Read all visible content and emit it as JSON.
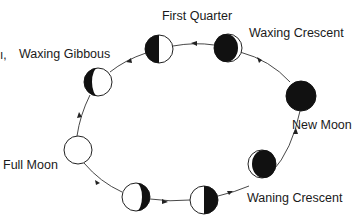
{
  "diagram": {
    "colors": {
      "dark": "#111111",
      "light": "#ffffff",
      "stroke": "#222222",
      "path": "#333333"
    },
    "partial_left_text": "ı,",
    "phases": [
      {
        "id": "new-moon",
        "label": "New Moon"
      },
      {
        "id": "waxing-crescent",
        "label": "Waxing Crescent"
      },
      {
        "id": "first-quarter",
        "label": "First Quarter"
      },
      {
        "id": "waxing-gibbous",
        "label": "Waxing Gibbous"
      },
      {
        "id": "full-moon",
        "label": "Full Moon"
      },
      {
        "id": "waning-gibbous",
        "label": ""
      },
      {
        "id": "last-quarter",
        "label": ""
      },
      {
        "id": "waning-crescent",
        "label": "Waning Crescent"
      }
    ]
  }
}
